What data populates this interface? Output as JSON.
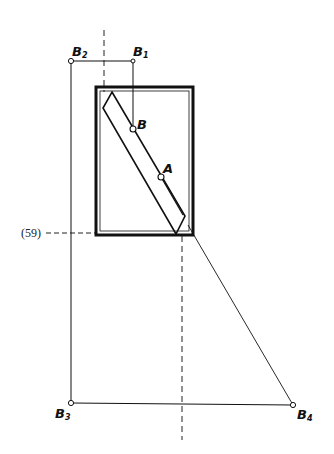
{
  "diagram": {
    "type": "technical-construction-drawing",
    "colors": {
      "ink": "#111111",
      "background": "#ffffff"
    },
    "points": [
      {
        "id": "B1",
        "label": "B",
        "subscript": "1",
        "x": 133,
        "y": 61
      },
      {
        "id": "B2",
        "label": "B",
        "subscript": "2",
        "x": 71,
        "y": 61
      },
      {
        "id": "B3",
        "label": "B",
        "subscript": "3",
        "x": 71,
        "y": 403
      },
      {
        "id": "B4",
        "label": "B",
        "subscript": "4",
        "x": 293,
        "y": 405
      },
      {
        "id": "B",
        "label": "B",
        "subscript": "",
        "x": 133,
        "y": 129
      },
      {
        "id": "A",
        "label": "A",
        "subscript": "",
        "x": 161,
        "y": 177
      }
    ],
    "dimension_label": "(59)",
    "frame": {
      "x": 96,
      "y": 87,
      "width": 97,
      "height": 148
    },
    "strip_corners": [
      [
        112,
        92
      ],
      [
        185,
        216
      ],
      [
        176,
        234
      ],
      [
        103,
        108
      ]
    ],
    "axes": {
      "left_dashed_x": 104,
      "right_dashed_x": 182,
      "horizontal_dashed_y": 233
    }
  }
}
